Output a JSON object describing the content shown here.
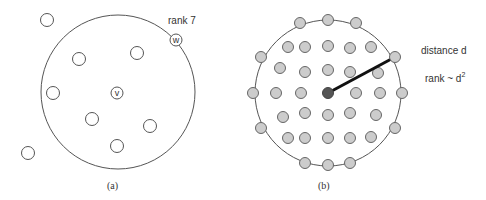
{
  "colors": {
    "stroke": "#555555",
    "node_fill_a": "#ffffff",
    "node_fill_b": "#cccccc",
    "center_fill_b": "#555555",
    "radius_line": "#111111",
    "text": "#333333"
  },
  "panel_a": {
    "caption": "(a)",
    "boundary": {
      "cx": 118,
      "cy": 92,
      "r": 77
    },
    "rank_label": "rank 7",
    "center_node": {
      "label": "v",
      "cx": 117,
      "cy": 93
    },
    "target_node": {
      "label": "w",
      "cx": 176,
      "cy": 40
    },
    "nodes_inside": [
      {
        "cx": 79,
        "cy": 59
      },
      {
        "cx": 137,
        "cy": 53
      },
      {
        "cx": 53,
        "cy": 93
      },
      {
        "cx": 92,
        "cy": 119
      },
      {
        "cx": 150,
        "cy": 126
      },
      {
        "cx": 117,
        "cy": 146
      }
    ],
    "nodes_outside": [
      {
        "cx": 47,
        "cy": 20
      },
      {
        "cx": 28,
        "cy": 153
      }
    ]
  },
  "panel_b": {
    "caption": "(b)",
    "boundary": {
      "cx": 328,
      "cy": 93,
      "r": 73
    },
    "distance_label": "distance d",
    "rank_label": "rank ~ d",
    "rank_label_exponent": "2",
    "center_node": {
      "cx": 328,
      "cy": 93
    },
    "radius_end": {
      "cx": 395,
      "cy": 57
    },
    "nodes": [
      {
        "cx": 300,
        "cy": 23
      },
      {
        "cx": 328,
        "cy": 20
      },
      {
        "cx": 356,
        "cy": 23
      },
      {
        "cx": 288,
        "cy": 47
      },
      {
        "cx": 305,
        "cy": 47
      },
      {
        "cx": 328,
        "cy": 46
      },
      {
        "cx": 350,
        "cy": 48
      },
      {
        "cx": 371,
        "cy": 47
      },
      {
        "cx": 261,
        "cy": 57
      },
      {
        "cx": 395,
        "cy": 57
      },
      {
        "cx": 280,
        "cy": 68
      },
      {
        "cx": 305,
        "cy": 72
      },
      {
        "cx": 328,
        "cy": 70
      },
      {
        "cx": 350,
        "cy": 72
      },
      {
        "cx": 378,
        "cy": 73
      },
      {
        "cx": 253,
        "cy": 93
      },
      {
        "cx": 276,
        "cy": 93
      },
      {
        "cx": 301,
        "cy": 93
      },
      {
        "cx": 356,
        "cy": 93
      },
      {
        "cx": 380,
        "cy": 93
      },
      {
        "cx": 402,
        "cy": 93
      },
      {
        "cx": 283,
        "cy": 117
      },
      {
        "cx": 305,
        "cy": 113
      },
      {
        "cx": 328,
        "cy": 115
      },
      {
        "cx": 350,
        "cy": 113
      },
      {
        "cx": 376,
        "cy": 115
      },
      {
        "cx": 261,
        "cy": 128
      },
      {
        "cx": 395,
        "cy": 128
      },
      {
        "cx": 288,
        "cy": 138
      },
      {
        "cx": 305,
        "cy": 138
      },
      {
        "cx": 328,
        "cy": 138
      },
      {
        "cx": 350,
        "cy": 138
      },
      {
        "cx": 371,
        "cy": 137
      },
      {
        "cx": 305,
        "cy": 163
      },
      {
        "cx": 328,
        "cy": 165
      },
      {
        "cx": 350,
        "cy": 163
      }
    ]
  }
}
